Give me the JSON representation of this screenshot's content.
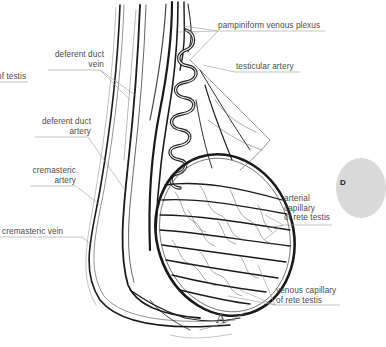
{
  "figure": {
    "panel_letter": "A",
    "side_badge_text": "D",
    "colors": {
      "background": "#ffffff",
      "vessel": "#1a1a1a",
      "leader": "#9a9a9a",
      "label": "#4a4a4a",
      "badge": "#d9d9d9"
    }
  },
  "labels": {
    "left": {
      "artery_of_testis_partial": "of testis",
      "deferent_duct_vein_1": "deferent duct",
      "deferent_duct_vein_2": "vein",
      "deferent_duct_artery_1": "deferent duct",
      "deferent_duct_artery_2": "artery",
      "cremasteric_artery_1": "cremasteric",
      "cremasteric_artery_2": "artery",
      "cremasteric_vein": "cremasteric vein"
    },
    "right": {
      "pampiniform": "pampiniform venous plexus",
      "testicular_artery": "testicular artery",
      "arterial_capillary_1": "arterial",
      "arterial_capillary_2": "capillary",
      "arterial_capillary_3": "of rete testis",
      "venous_capillary_1": "venous capillary",
      "venous_capillary_2": "of rete testis"
    }
  }
}
